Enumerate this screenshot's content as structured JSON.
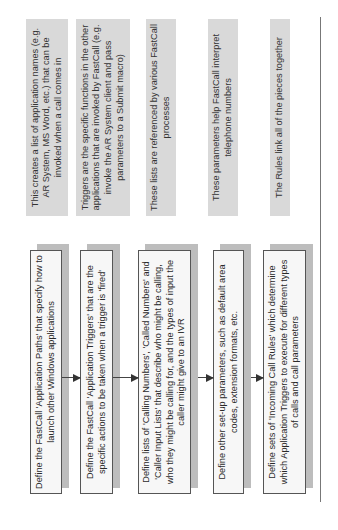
{
  "diagram": {
    "steps": [
      {
        "label": "Define the FastCall 'Application Paths' that specify how to launch other Windows applications",
        "note": "This creates a list of application names (e.g. AR System, MS Word, etc.) that can be invoked when a call comes in"
      },
      {
        "label": "Define the FastCall 'Application Triggers' that are the specific actions to be taken when a trigger is 'fired'",
        "note": "Triggers are the specific functions in the other applications that are invoked by FastCall (e.g. invoke the AR System client and pass parameters to a Submit macro)"
      },
      {
        "label": "Define lists of 'Calling Numbers', 'Called Numbers' and 'Caller Input Lists' that describe who might be calling, who they might be calling for, and the types of input the caller might give to an IVR",
        "note": "These lists are referenced by various FastCall processes"
      },
      {
        "label": "Define other set-up parameters, such as default area codes, extension formats, etc.",
        "note": "These parameters help FastCall interpret telephone numbers"
      },
      {
        "label": "Define sets of 'Incoming Call Rules' which determine which Application Triggers to execute for different types of calls and call parameters",
        "note": "The Rules link all of the pieces together"
      }
    ],
    "colors": {
      "note_fill": "#d9d9d9",
      "step_fill": "#f7f7f7",
      "step_border": "#555555",
      "shadow": "#bdbdbd"
    }
  }
}
